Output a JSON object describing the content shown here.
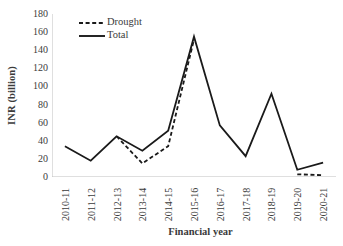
{
  "chart_data": {
    "type": "line",
    "title": "",
    "xlabel": "Financial year",
    "ylabel": "INR (billion)",
    "categories": [
      "2010-11",
      "2011-12",
      "2012-13",
      "2013-14",
      "2014-15",
      "2015-16",
      "2016-17",
      "2017-18",
      "2018-19",
      "2019-20",
      "2020-21"
    ],
    "series": [
      {
        "name": "Drought",
        "style": "dashed",
        "color": "#1a1a1a",
        "values": [
          null,
          null,
          45,
          15,
          34,
          152,
          null,
          null,
          null,
          3,
          2
        ]
      },
      {
        "name": "Total",
        "style": "solid",
        "color": "#1a1a1a",
        "values": [
          34,
          18,
          45,
          29,
          51,
          155,
          57,
          23,
          92,
          8,
          16
        ]
      }
    ],
    "ylim": [
      0,
      180
    ],
    "ytick_step": 20,
    "yticks": [
      "0",
      "20",
      "40",
      "60",
      "80",
      "100",
      "120",
      "140",
      "160",
      "180"
    ],
    "grid": false,
    "legend_position": "upper-left-inside",
    "axis_color": "#bfbfbf",
    "text_color": "#3b3b3b"
  },
  "legend": {
    "entries": [
      {
        "label": "Drought",
        "swatch": "dashed-line-swatch"
      },
      {
        "label": "Total",
        "swatch": "solid-line-swatch"
      }
    ]
  }
}
